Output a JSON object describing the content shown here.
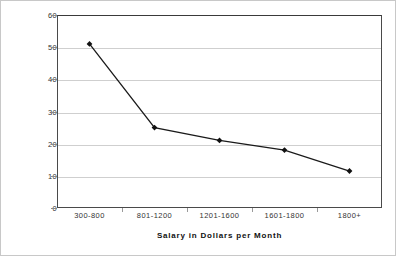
{
  "chart_data": {
    "type": "line",
    "title": "",
    "xlabel": "Salary in Dollars per Month",
    "ylabel": "Remittance as a Percent of Salary",
    "categories": [
      "300-800",
      "801-1200",
      "1201-1600",
      "1601-1800",
      "1800+"
    ],
    "values": [
      51,
      25,
      21,
      18,
      11.5
    ],
    "series": [
      {
        "name": "Remittance as a Percent of Salary",
        "values": [
          51,
          25,
          21,
          18,
          11.5
        ]
      }
    ],
    "ylim": [
      0,
      60
    ],
    "yticks": [
      0,
      10,
      20,
      30,
      40,
      50,
      60
    ],
    "ytick_labels": [
      "0",
      "10",
      "20",
      "30",
      "40",
      "50",
      "60"
    ],
    "grid": "horizontal",
    "legend": "none",
    "marker": "filled-diamond",
    "line_color": "#1a1a1a",
    "marker_color": "#111111",
    "gridline_color": "#cfcfcf",
    "plot_border_color": "#4a4a4a",
    "background_color": "#ffffff"
  }
}
